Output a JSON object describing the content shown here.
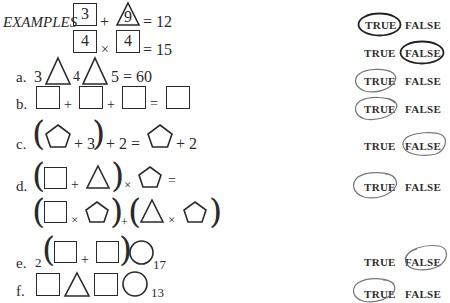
{
  "header": {
    "examples_label": "EXAMPLES"
  },
  "examples": [
    {
      "left_box": "3",
      "op": "+",
      "triangle": "9",
      "result": "= 12",
      "answer": "TRUE"
    },
    {
      "left_box": "4",
      "op": "×",
      "right_box": "4",
      "result": "= 15",
      "answer": "FALSE"
    }
  ],
  "problems": [
    {
      "label": "a.",
      "n1": "3",
      "n2": "4",
      "tail": "5 = 60",
      "answer": "TRUE"
    },
    {
      "label": "b.",
      "plus1": "+",
      "plus2": "+",
      "eq": "=",
      "answer": "TRUE"
    },
    {
      "label": "c.",
      "inner": "+ 3",
      "mid": "+ 2 =",
      "tail": "+ 2",
      "answer": "FALSE"
    },
    {
      "label": "d.",
      "plus": "+",
      "times": "×",
      "eq": "=",
      "times2": "×",
      "plus2": "+",
      "times3": "×",
      "answer": "TRUE"
    },
    {
      "label": "e.",
      "coef": "2",
      "plus": "+",
      "sub": "17",
      "answer": "FALSE"
    },
    {
      "label": "f.",
      "sub": "13",
      "answer": "TRUE"
    }
  ],
  "options": {
    "true_label": "TRUE",
    "false_label": "FALSE"
  },
  "colors": {
    "ink": "#2a2a2a",
    "pencil": "#777777"
  }
}
